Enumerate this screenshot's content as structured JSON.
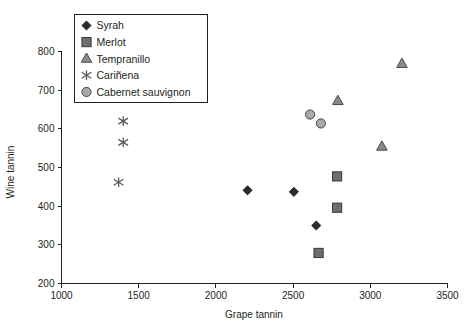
{
  "chart_data": {
    "type": "scatter",
    "title": "",
    "xlabel": "Grape tannin",
    "ylabel": "Wine tannin",
    "xlim": [
      1000,
      3500
    ],
    "ylim": [
      200,
      800
    ],
    "xticks": [
      1000,
      1500,
      2000,
      2500,
      3000,
      3500
    ],
    "yticks": [
      200,
      300,
      400,
      500,
      600,
      700,
      800
    ],
    "grid": false,
    "legend_position": "top-left-inside",
    "series": [
      {
        "name": "Syrah",
        "marker": "diamond",
        "color": "#2b2b2b",
        "points": [
          {
            "x": 2205,
            "y": 441
          },
          {
            "x": 2505,
            "y": 437
          },
          {
            "x": 2650,
            "y": 350
          }
        ]
      },
      {
        "name": "Merlot",
        "marker": "square",
        "color": "#6e6e6e",
        "points": [
          {
            "x": 2785,
            "y": 477
          },
          {
            "x": 2785,
            "y": 396
          },
          {
            "x": 2665,
            "y": 279
          }
        ]
      },
      {
        "name": "Tempranillo",
        "marker": "triangle",
        "color": "#8a8a8a",
        "points": [
          {
            "x": 2790,
            "y": 672
          },
          {
            "x": 3205,
            "y": 768
          },
          {
            "x": 3075,
            "y": 554
          }
        ]
      },
      {
        "name": "Cariñena",
        "marker": "asterisk",
        "color": "#5a5a5a",
        "points": [
          {
            "x": 1400,
            "y": 620
          },
          {
            "x": 1400,
            "y": 565
          },
          {
            "x": 1370,
            "y": 462
          }
        ]
      },
      {
        "name": "Cabernet sauvignon",
        "marker": "circle",
        "color": "#a9a9a9",
        "points": [
          {
            "x": 2610,
            "y": 637
          },
          {
            "x": 2680,
            "y": 614
          }
        ]
      }
    ]
  },
  "axes": {
    "x_title": "Grape tannin",
    "y_title": "Wine tannin",
    "x_tick_labels": [
      "1000",
      "1500",
      "2000",
      "2500",
      "3000",
      "3500"
    ],
    "y_tick_labels": [
      "200",
      "300",
      "400",
      "500",
      "600",
      "700",
      "800"
    ]
  },
  "legend": {
    "items": [
      {
        "label": "Syrah",
        "marker": "diamond"
      },
      {
        "label": "Merlot",
        "marker": "square"
      },
      {
        "label": "Tempranillo",
        "marker": "triangle"
      },
      {
        "label": "Cariñena",
        "marker": "asterisk"
      },
      {
        "label": "Cabernet sauvignon",
        "marker": "circle"
      }
    ]
  },
  "colors": {
    "axis": "#231f20",
    "syrah": "#2b2b2b",
    "merlot": "#6e6e6e",
    "tempranillo": "#8a8a8a",
    "carinena": "#5a5a5a",
    "cabernet": "#a9a9a9",
    "background": "#ffffff"
  }
}
